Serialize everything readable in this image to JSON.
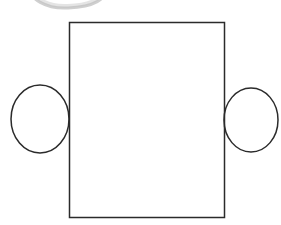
{
  "canvas": {
    "width": 281,
    "height": 225,
    "background_color": "#ffffff",
    "title": "Line diagram: rectangle flanked by two circles"
  },
  "style": {
    "stroke_color": "#2b2b2b",
    "stroke_width": 1.5,
    "fill": "none",
    "faint_stroke_color": "#b9b9b9",
    "faint_stroke_width": 3
  },
  "shapes": [
    {
      "name": "central-rectangle",
      "type": "rect",
      "x": 69.5,
      "y": 22.5,
      "width": 155,
      "height": 195,
      "stroke": "#2b2b2b",
      "stroke_width": 1.5,
      "fill": "none"
    },
    {
      "name": "left-circle",
      "type": "ellipse",
      "cx": 40,
      "cy": 119,
      "rx": 29,
      "ry": 34,
      "stroke": "#2b2b2b",
      "stroke_width": 1.5,
      "fill": "none"
    },
    {
      "name": "right-circle",
      "type": "ellipse",
      "cx": 251,
      "cy": 120,
      "rx": 27,
      "ry": 32,
      "stroke": "#2b2b2b",
      "stroke_width": 1.5,
      "fill": "none"
    },
    {
      "name": "faint-top-arc",
      "type": "path",
      "d": "M 26 -22 C 26 2 50 9 68 8 C 90 7 110 2 110 -22",
      "stroke": "#bfbfbf",
      "stroke_width": 3,
      "fill": "none",
      "opacity": 0.75
    },
    {
      "name": "faint-top-arc-shadow",
      "type": "path",
      "d": "M 30 -18 C 31 1 52 7 68 6 C 88 5 105 1 106 -18",
      "stroke": "#d8d8d8",
      "stroke_width": 4,
      "fill": "none",
      "opacity": 0.7
    }
  ]
}
